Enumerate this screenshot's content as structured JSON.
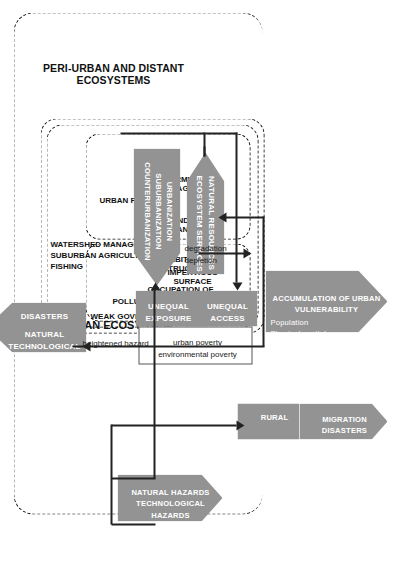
{
  "diagram": {
    "title_peri_urban": "PERI-URBAN AND DISTANT\nECOSYSTEMS",
    "title_urban_ecosystem": "URBAN ECOSYSTEM",
    "flows": {
      "natural_resources": "NATURAL RESOURCES\nECOSYSTEM SERVICES",
      "urbanization": "URBANIZATION\nSUBURBANIZATION\nCOUNTERURBANIZATION",
      "degradation": "degradation\ndepletion",
      "heightened_hazard": "heightened hazard"
    },
    "left_column": {
      "accumulation": "ACCUMULATION OF URBAN\nVULNERABILITY",
      "accumulation_items": "Population\nPhysical capital\nEconomic activity",
      "unequal_exposure": "UNEQUAL\nEXPOSURE",
      "unequal_access": "UNEQUAL\nACCESS",
      "poverty_note": "urban poverty\nenvironmental poverty",
      "migration": "MIGRATION\nDISASTERS",
      "rural": "RURAL"
    },
    "pressures": {
      "weak_governance": "WEAK GOVERNANCE",
      "items": [
        "POLLUTION",
        "OCCUPATION OF\nHAZARD-PRONE\nAREAS",
        "IMPERVIOUS\nSURFACE",
        "HABITAT\nDESTRUCTION"
      ]
    },
    "responses": {
      "items": [
        "LAND-USE\nPLANNING",
        "URBAN FORESTRY",
        "STORMWATER\nMANAGEMENT"
      ],
      "outer_items": "WATERSHED MANAGEMENT\nSUBURBAN AGRICULTURE\nFISHING"
    },
    "hazards": {
      "natural_hazards": "NATURAL HAZARDS\nTECHNOLOGICAL\nHAZARDS"
    },
    "disasters": {
      "label": "DISASTERS",
      "types": "NATURAL\nTECHNOLOGICAL\nNATECH"
    },
    "colors": {
      "arrow_gray": "#939393",
      "line": "#222222",
      "text_light": "#ffffff",
      "text_dark": "#111111"
    }
  }
}
